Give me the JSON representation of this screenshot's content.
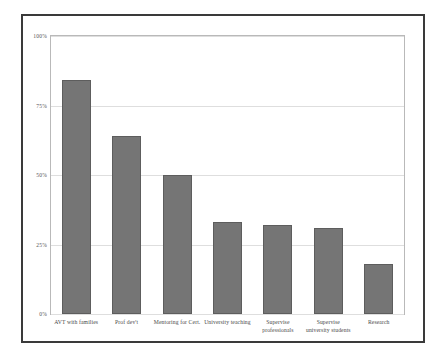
{
  "chart_data": {
    "type": "bar",
    "title": "",
    "subtitle": "",
    "xlabel": "",
    "ylabel": "",
    "ylim": [
      0,
      100
    ],
    "grid": true,
    "legend": "none",
    "orientation": "vertical",
    "bar_color": "#757575",
    "bar_border_color": "#5d5d5d",
    "gridline_color": "#dedede",
    "frame_color": "#3a3a3a",
    "plot_border_color": "#b9b9b9",
    "ytick_labels": [
      "100%",
      "75%",
      "50%",
      "25%",
      "0%"
    ],
    "ytick_values": [
      100,
      75,
      50,
      25,
      0
    ],
    "categories": [
      "AVT with families",
      "Prof dev't",
      "Mentoring for Cert.",
      "University teaching",
      "Supervise professionals",
      "Supervise university students",
      "Research"
    ],
    "values": [
      84,
      64,
      50,
      33,
      32,
      31,
      18
    ],
    "value_suffix": "%"
  }
}
